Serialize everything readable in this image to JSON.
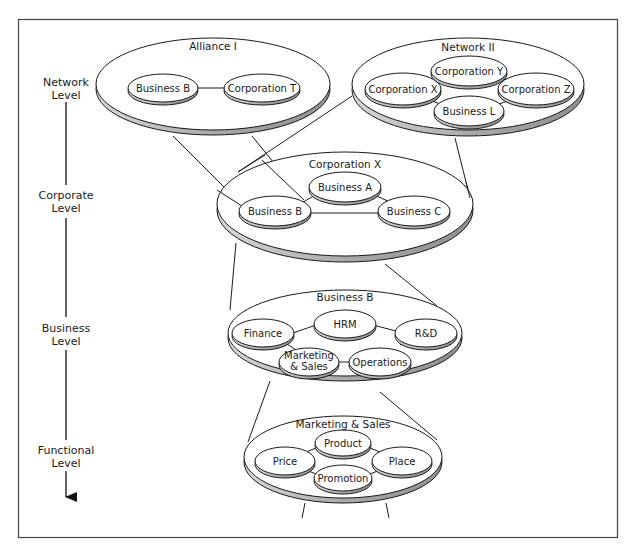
{
  "diagram": {
    "type": "hierarchical-levels-of-strategy",
    "frame": {
      "border_color": "#444444",
      "background": "#ffffff"
    },
    "colors": {
      "ellipse_fill": "#ffffff",
      "ellipse_stroke": "#1a1a1a",
      "rim_fill": "#b5b5b5",
      "line": "#1a1a1a"
    },
    "levels": [
      {
        "line1": "Network",
        "line2": "Level"
      },
      {
        "line1": "Corporate",
        "line2": "Level"
      },
      {
        "line1": "Business",
        "line2": "Level"
      },
      {
        "line1": "Functional",
        "line2": "Level"
      }
    ],
    "groups": {
      "alliance": {
        "title": "Alliance I",
        "nodes": [
          "Business B",
          "Corporation T"
        ]
      },
      "network": {
        "title": "Network II",
        "nodes": [
          "Corporation X",
          "Corporation Y",
          "Corporation Z",
          "Business L"
        ]
      },
      "corporation": {
        "title": "Corporation X",
        "nodes": [
          "Business A",
          "Business B",
          "Business C"
        ]
      },
      "business": {
        "title": "Business B",
        "nodes": [
          "Finance",
          "HRM",
          "R&D",
          "Operations"
        ],
        "marketing_line1": "Marketing",
        "marketing_line2": "& Sales"
      },
      "functional": {
        "title": "Marketing & Sales",
        "nodes": [
          "Product",
          "Price",
          "Place",
          "Promotion"
        ]
      }
    }
  }
}
